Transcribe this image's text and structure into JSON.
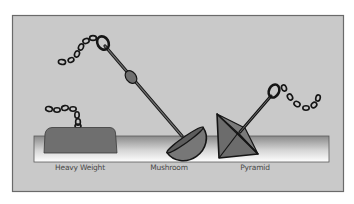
{
  "diagram": {
    "type": "anchor-types-illustration",
    "colors": {
      "panel_background": "#c9c9c9",
      "panel_border": "#6a6a6a",
      "seabed_top": "#8c8c8c",
      "seabed_bottom": "#ffffff",
      "anchor_fill": "#6f6f6f",
      "mushroom_fill": "#757575",
      "outline": "#151515",
      "label_text": "#4a4a4a"
    },
    "anchors": [
      {
        "id": "heavy-weight",
        "label": "Heavy Weight"
      },
      {
        "id": "mushroom",
        "label": "Mushroom"
      },
      {
        "id": "pyramid",
        "label": "Pyramid"
      }
    ]
  }
}
